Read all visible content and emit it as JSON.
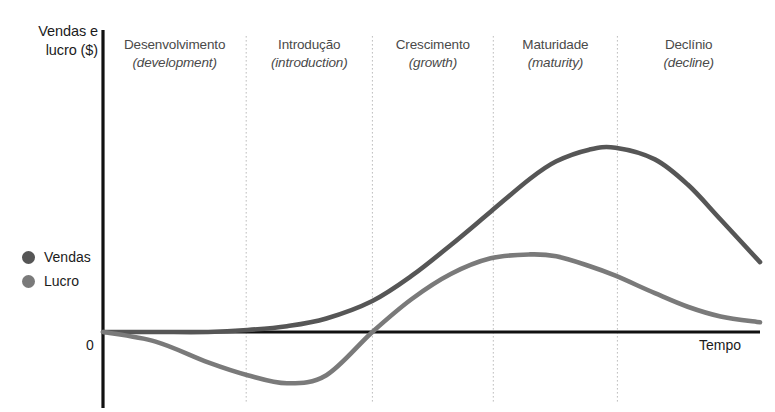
{
  "chart_data": {
    "type": "line",
    "title": "",
    "xlabel": "Tempo",
    "ylabel": "Vendas e lucro ($)",
    "ylabel_lines": [
      "Vendas e",
      "lucro ($)"
    ],
    "origin_label": "0",
    "grid": false,
    "legend_position": "left",
    "axis_color": "#111111",
    "divider_color": "#bdbdbd",
    "background": "#ffffff",
    "xlim": [
      0,
      100
    ],
    "ylim": [
      -40,
      100
    ],
    "phases": [
      {
        "name": "Desenvolvimento",
        "english": "(development)",
        "x_start": 0,
        "x_end": 21.8
      },
      {
        "name": "Introdução",
        "english": "(introduction)",
        "x_start": 21.8,
        "x_end": 41.0
      },
      {
        "name": "Crescimento",
        "english": "(growth)",
        "x_start": 41.0,
        "x_end": 59.4
      },
      {
        "name": "Maturidade",
        "english": "(maturity)",
        "x_start": 59.4,
        "x_end": 78.3
      },
      {
        "name": "Declínio",
        "english": "(decline)",
        "x_start": 78.3,
        "x_end": 100
      }
    ],
    "series": [
      {
        "name": "Vendas",
        "color": "#565656",
        "x": [
          0,
          8,
          16,
          22,
          28,
          34,
          41,
          47,
          53,
          59,
          65,
          69,
          74,
          78,
          84,
          89,
          94,
          100
        ],
        "values": [
          0,
          0,
          0,
          1,
          3,
          7,
          16,
          29,
          45,
          62,
          79,
          88,
          94,
          95,
          89,
          76,
          58,
          36
        ]
      },
      {
        "name": "Lucro",
        "color": "#7a7a7a",
        "x": [
          0,
          8,
          16,
          22,
          28,
          34,
          41,
          47,
          53,
          59,
          65,
          69,
          74,
          78,
          84,
          89,
          94,
          100
        ],
        "values": [
          0,
          -6,
          -19,
          -27,
          -32,
          -27,
          0,
          17,
          30,
          38,
          40,
          39,
          34,
          29,
          20,
          13,
          8,
          5
        ]
      }
    ],
    "legend": [
      {
        "label": "Vendas",
        "color": "#565656"
      },
      {
        "label": "Lucro",
        "color": "#7a7a7a"
      }
    ]
  }
}
